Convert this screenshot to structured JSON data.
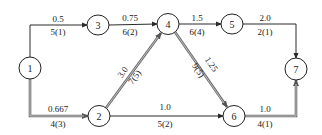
{
  "diagram": {
    "type": "activity-network",
    "colors": {
      "normal_edge": "#2a2a2a",
      "critical_edge_outer": "#6a6a6a",
      "critical_edge_inner": "#d8d8d8",
      "node_stroke": "#222222",
      "node_fill": "#ffffff"
    },
    "nodes": [
      {
        "id": "1",
        "label": "1",
        "x": 30,
        "y": 68
      },
      {
        "id": "2",
        "label": "2",
        "x": 99,
        "y": 116
      },
      {
        "id": "3",
        "label": "3",
        "x": 98,
        "y": 25
      },
      {
        "id": "4",
        "label": "4",
        "x": 168,
        "y": 24
      },
      {
        "id": "5",
        "label": "5",
        "x": 232,
        "y": 24
      },
      {
        "id": "6",
        "label": "6",
        "x": 234,
        "y": 116
      },
      {
        "id": "7",
        "label": "7",
        "x": 296,
        "y": 69
      }
    ],
    "edges": [
      {
        "from": "1",
        "to": "3",
        "top_label": "0.5",
        "bottom_label": "5(1)",
        "critical": false
      },
      {
        "from": "1",
        "to": "2",
        "top_label": "0.667",
        "bottom_label": "4(3)",
        "critical": true
      },
      {
        "from": "3",
        "to": "4",
        "top_label": "0.75",
        "bottom_label": "6(2)",
        "critical": false
      },
      {
        "from": "2",
        "to": "4",
        "top_label": "3.0",
        "bottom_label": "7(5)",
        "critical": true
      },
      {
        "from": "4",
        "to": "5",
        "top_label": "1.5",
        "bottom_label": "6(4)",
        "critical": false
      },
      {
        "from": "4",
        "to": "6",
        "top_label": "1.25",
        "bottom_label": "9(5)",
        "critical": true
      },
      {
        "from": "2",
        "to": "6",
        "top_label": "1.0",
        "bottom_label": "5(2)",
        "critical": false
      },
      {
        "from": "5",
        "to": "7",
        "top_label": "2.0",
        "bottom_label": "2(1)",
        "critical": false
      },
      {
        "from": "6",
        "to": "7",
        "top_label": "1.0",
        "bottom_label": "4(1)",
        "critical": true
      }
    ]
  }
}
